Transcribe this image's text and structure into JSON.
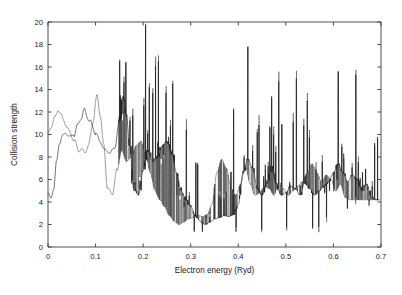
{
  "figure": {
    "background_color": "#ffffff",
    "plot_box": {
      "left": 48,
      "top": 22,
      "right": 381,
      "bottom": 247
    }
  },
  "chart_data": {
    "type": "line",
    "title": "",
    "xlabel": "Electron energy (Ryd)",
    "ylabel": "Collision strength",
    "xlim": [
      0,
      0.7
    ],
    "ylim": [
      0,
      20
    ],
    "xticks": [
      0,
      0.1,
      0.2,
      0.3,
      0.4,
      0.5,
      0.6,
      0.7
    ],
    "xtick_labels": [
      "0",
      "0.1",
      "0.2",
      "0.3",
      "0.4",
      "0.5",
      "0.6",
      "0.7"
    ],
    "yticks": [
      0,
      2,
      4,
      6,
      8,
      10,
      12,
      14,
      16,
      18,
      20
    ],
    "ytick_labels": [
      "0",
      "2",
      "4",
      "6",
      "8",
      "10",
      "12",
      "14",
      "16",
      "18",
      "20"
    ],
    "grid": false,
    "legend": "none",
    "tick_direction": "in",
    "frame": "box",
    "series": [
      {
        "name": "solid-curve",
        "style": "solid",
        "color": "#1c1c1c",
        "description": "Collision strength including resonances (solid line)"
      },
      {
        "name": "dotted-curve",
        "style": "dotted",
        "color": "#4a4a4a",
        "description": "Collision strength including resonances (dotted line)"
      }
    ],
    "baseline_x": [
      0.0,
      0.006,
      0.012,
      0.018,
      0.024,
      0.03,
      0.038,
      0.046,
      0.054,
      0.062,
      0.07,
      0.076,
      0.082,
      0.088,
      0.094,
      0.1,
      0.11,
      0.12,
      0.13,
      0.14,
      0.15,
      0.158,
      0.165,
      0.172,
      0.18,
      0.19,
      0.2,
      0.21,
      0.22,
      0.23,
      0.24,
      0.25,
      0.26,
      0.27,
      0.28,
      0.29,
      0.3,
      0.31,
      0.32,
      0.33,
      0.34,
      0.35,
      0.36,
      0.37,
      0.38,
      0.39,
      0.4,
      0.41,
      0.42,
      0.43,
      0.44,
      0.45,
      0.46,
      0.47,
      0.48,
      0.49,
      0.5,
      0.51,
      0.52,
      0.53,
      0.54,
      0.55,
      0.56,
      0.57,
      0.58,
      0.59,
      0.6,
      0.61,
      0.62,
      0.63,
      0.64,
      0.65,
      0.66,
      0.67,
      0.68,
      0.69
    ],
    "baseline_y": [
      4.8,
      4.3,
      5.2,
      7.6,
      9.2,
      9.9,
      10.1,
      9.8,
      10.0,
      10.7,
      11.6,
      12.1,
      11.7,
      11.2,
      10.6,
      10.2,
      9.3,
      8.6,
      8.4,
      8.8,
      11.2,
      13.4,
      11.6,
      9.0,
      5.2,
      4.6,
      6.8,
      8.6,
      7.6,
      8.0,
      9.0,
      9.4,
      8.4,
      6.6,
      5.0,
      4.2,
      3.6,
      2.8,
      2.3,
      2.0,
      2.2,
      2.5,
      2.6,
      2.8,
      2.7,
      2.9,
      3.8,
      6.6,
      7.8,
      7.0,
      5.2,
      4.6,
      5.6,
      7.2,
      5.6,
      4.6,
      4.8,
      5.4,
      5.2,
      4.6,
      5.8,
      5.2,
      4.6,
      5.0,
      5.4,
      5.8,
      6.6,
      7.4,
      6.6,
      5.8,
      6.4,
      6.0,
      5.0,
      5.6,
      4.4,
      4.2
    ],
    "notable_peaks": [
      {
        "x": 0.205,
        "y": 19.7,
        "label": "tallest resonance"
      },
      {
        "x": 0.232,
        "y": 16.5
      },
      {
        "x": 0.079,
        "y": 12.2
      },
      {
        "x": 0.152,
        "y": 13.5
      },
      {
        "x": 0.262,
        "y": 14.5
      },
      {
        "x": 0.61,
        "y": 15.6
      },
      {
        "x": 0.647,
        "y": 15.3
      },
      {
        "x": 0.47,
        "y": 13.4
      },
      {
        "x": 0.545,
        "y": 13.0
      },
      {
        "x": 0.39,
        "y": 12.2
      }
    ],
    "resonance_region": {
      "start": 0.145,
      "end": 0.695
    },
    "smooth_region": {
      "start": 0.0,
      "end": 0.145
    }
  }
}
